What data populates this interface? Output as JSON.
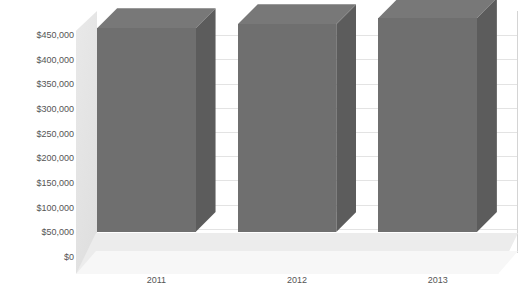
{
  "chart_data": {
    "type": "bar",
    "title": "",
    "subtitle": "",
    "xlabel": "",
    "ylabel": "",
    "categories": [
      "2011",
      "2012",
      "2013"
    ],
    "values": [
      413000,
      421000,
      434000
    ],
    "series": [
      {
        "name": "",
        "values": [
          413000,
          421000,
          434000
        ]
      }
    ],
    "ylim": [
      0,
      450000
    ],
    "y_tick_values": [
      0,
      50000,
      100000,
      150000,
      200000,
      250000,
      300000,
      350000,
      400000,
      450000
    ],
    "y_tick_labels": [
      "$0",
      "$50,000",
      "$100,000",
      "$150,000",
      "$200,000",
      "$250,000",
      "$300,000",
      "$350,000",
      "$400,000",
      "$450,000"
    ],
    "x_tick_labels": [
      "2011",
      "2012",
      "2013"
    ],
    "grid": true,
    "grid_axis": "y",
    "legend": false,
    "legend_position": "none",
    "annotations": [],
    "style": "3d-column",
    "colors": {
      "bar_front": "#6f6f6f",
      "bar_top": "#787878",
      "bar_side": "#5c5c5c",
      "floor": "#ececec",
      "wall": "#e4e4e4",
      "gridline": "#e3e3e3",
      "background": "#ffffff",
      "text": "#555555"
    }
  },
  "title_text": ""
}
